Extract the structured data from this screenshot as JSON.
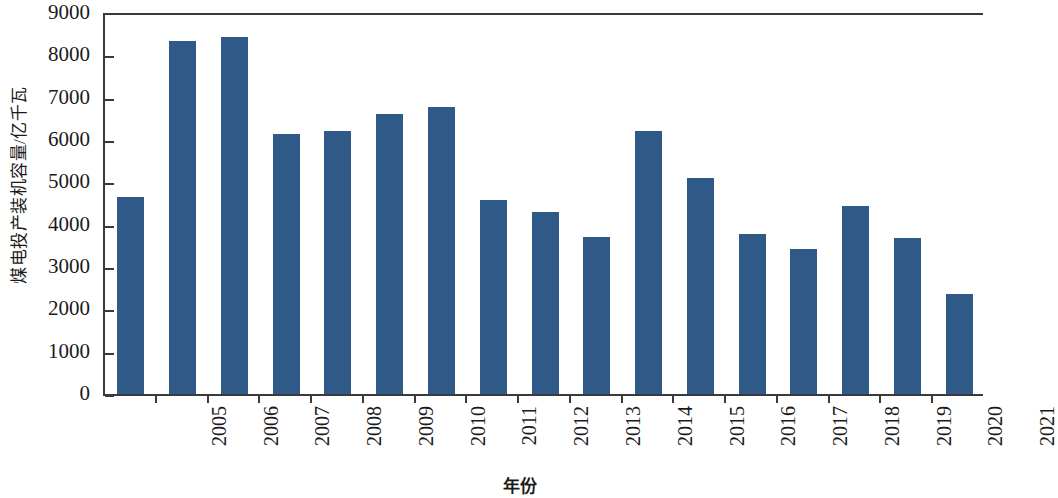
{
  "chart_data": {
    "type": "bar",
    "title": "",
    "subtitle": "",
    "xlabel": "年份",
    "ylabel": "煤电投产装机容量/亿千瓦",
    "categories": [
      "2005",
      "2006",
      "2007",
      "2008",
      "2009",
      "2010",
      "2011",
      "2012",
      "2013",
      "2014",
      "2015",
      "2016",
      "2017",
      "2018",
      "2019",
      "2020",
      "2021"
    ],
    "values": [
      4700,
      8390,
      8480,
      6190,
      6260,
      6650,
      6830,
      4640,
      4340,
      3760,
      6260,
      5150,
      3830,
      3470,
      4490,
      3730,
      2400
    ],
    "series": [
      {
        "name": "煤电投产装机容量",
        "values": [
          4700,
          8390,
          8480,
          6190,
          6260,
          6650,
          6830,
          4640,
          4340,
          3760,
          6260,
          5150,
          3830,
          3470,
          4490,
          3730,
          2400
        ]
      }
    ],
    "ylim": [
      0,
      9000
    ],
    "yticks": [
      0,
      1000,
      2000,
      3000,
      4000,
      5000,
      6000,
      7000,
      8000,
      9000
    ],
    "ytick_labels": [
      "0",
      "1000",
      "2000",
      "3000",
      "4000",
      "5000",
      "6000",
      "7000",
      "8000",
      "9000"
    ],
    "grid": false,
    "legend": false,
    "legend_position": "none",
    "bar_color": "#2f5a87",
    "axis_color": "#3a3a3a",
    "background_color": "#ffffff",
    "xtick_rotation": 90,
    "annotations": []
  }
}
